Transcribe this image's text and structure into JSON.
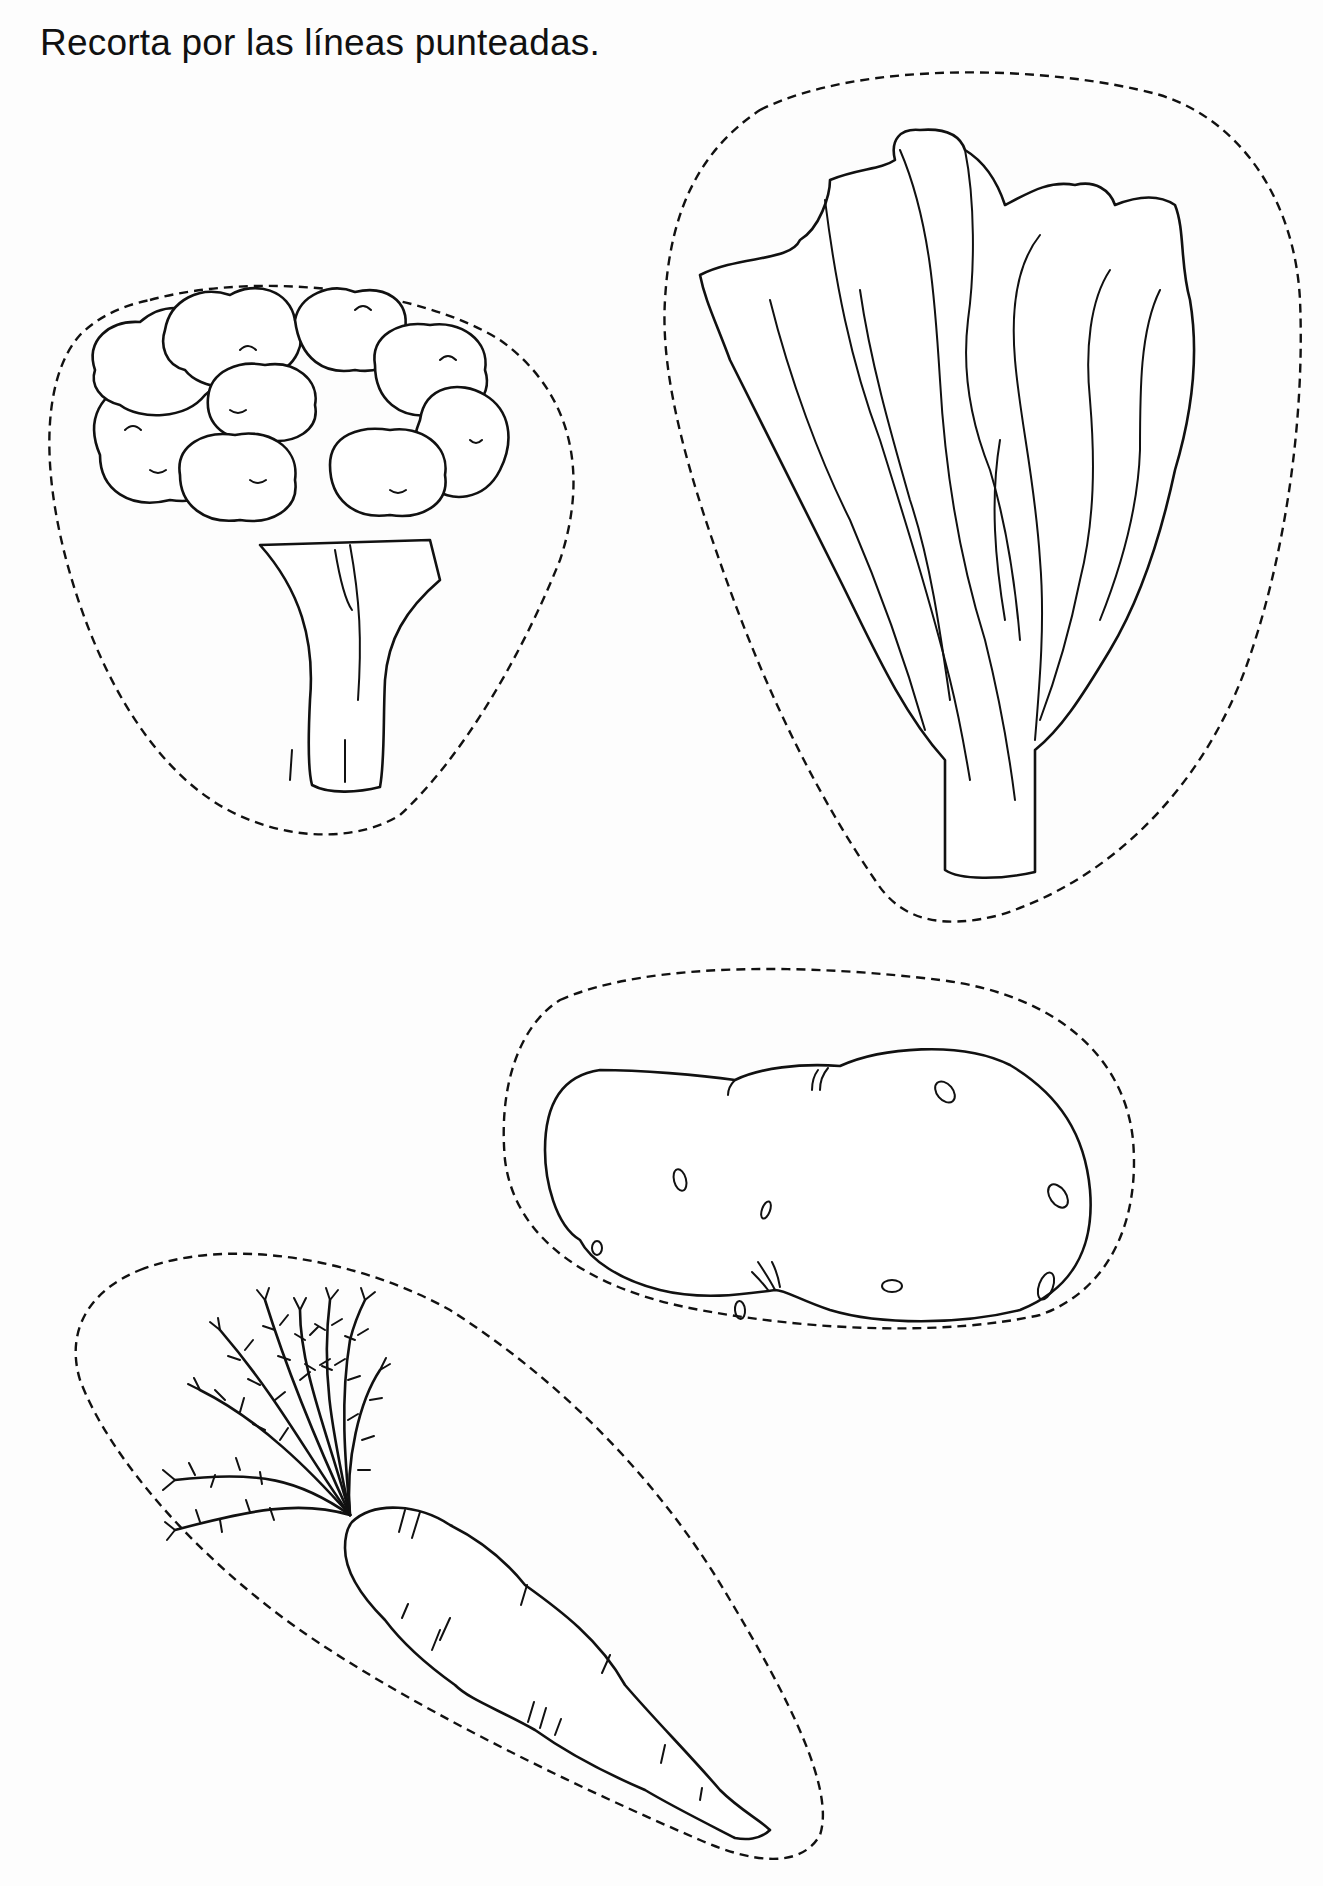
{
  "worksheet": {
    "instruction": "Recorta por las líneas punteadas.",
    "background": "#ffffff",
    "line_color": "#111111",
    "cutouts": [
      {
        "id": "broccoli",
        "label": "brócoli"
      },
      {
        "id": "lettuce",
        "label": "lechuga"
      },
      {
        "id": "potato",
        "label": "papa"
      },
      {
        "id": "carrot",
        "label": "zanahoria"
      }
    ]
  }
}
